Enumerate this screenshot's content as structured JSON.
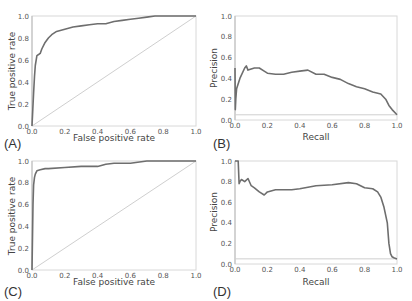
{
  "chart_data": [
    {
      "id": "A",
      "panel_label": "(A)",
      "type": "line",
      "title": "",
      "xlabel": "False positive rate",
      "ylabel": "True positive rate",
      "xlim": [
        0,
        1
      ],
      "ylim": [
        0,
        1
      ],
      "xticks": [
        "0.0",
        "0.2",
        "0.4",
        "0.6",
        "0.8",
        "1.0"
      ],
      "yticks": [
        "0.0",
        "0.2",
        "0.4",
        "0.6",
        "0.8",
        "1.0"
      ],
      "grid": false,
      "diagonal": true,
      "series": [
        {
          "name": "ROC",
          "x": [
            0,
            0.005,
            0.01,
            0.015,
            0.02,
            0.03,
            0.04,
            0.05,
            0.06,
            0.08,
            0.1,
            0.12,
            0.15,
            0.2,
            0.25,
            0.3,
            0.35,
            0.4,
            0.45,
            0.5,
            0.55,
            0.6,
            0.65,
            0.7,
            0.75,
            0.8,
            0.9,
            1.0
          ],
          "y": [
            0,
            0.15,
            0.3,
            0.45,
            0.55,
            0.64,
            0.65,
            0.66,
            0.7,
            0.76,
            0.8,
            0.83,
            0.86,
            0.88,
            0.9,
            0.91,
            0.92,
            0.93,
            0.93,
            0.95,
            0.96,
            0.97,
            0.98,
            0.99,
            1.0,
            1.0,
            1.0,
            1.0
          ]
        }
      ]
    },
    {
      "id": "B",
      "panel_label": "(B)",
      "type": "line",
      "title": "",
      "xlabel": "Recall",
      "ylabel": "Precision",
      "xlim": [
        0,
        1
      ],
      "ylim": [
        0,
        1
      ],
      "xticks": [
        "0.0",
        "0.2",
        "0.4",
        "0.6",
        "0.8",
        "1.0"
      ],
      "yticks": [
        "0.0",
        "0.2",
        "0.4",
        "0.6",
        "0.8",
        "1.0"
      ],
      "grid": false,
      "baseline": 0.05,
      "series": [
        {
          "name": "PR",
          "x": [
            0,
            0.002,
            0.005,
            0.01,
            0.03,
            0.06,
            0.07,
            0.08,
            0.1,
            0.12,
            0.15,
            0.18,
            0.2,
            0.25,
            0.3,
            0.35,
            0.4,
            0.45,
            0.5,
            0.55,
            0.6,
            0.65,
            0.7,
            0.75,
            0.8,
            0.85,
            0.9,
            0.93,
            0.95,
            0.97,
            1.0
          ],
          "y": [
            0.5,
            0.1,
            0.2,
            0.3,
            0.4,
            0.5,
            0.52,
            0.48,
            0.49,
            0.5,
            0.5,
            0.47,
            0.45,
            0.44,
            0.44,
            0.46,
            0.47,
            0.48,
            0.44,
            0.44,
            0.41,
            0.39,
            0.35,
            0.32,
            0.3,
            0.27,
            0.25,
            0.2,
            0.14,
            0.1,
            0.05
          ]
        }
      ]
    },
    {
      "id": "C",
      "panel_label": "(C)",
      "type": "line",
      "title": "",
      "xlabel": "False positive rate",
      "ylabel": "True positive rate",
      "xlim": [
        0,
        1
      ],
      "ylim": [
        0,
        1
      ],
      "xticks": [
        "0.0",
        "0.2",
        "0.4",
        "0.6",
        "0.8",
        "1.0"
      ],
      "yticks": [
        "0.0",
        "0.2",
        "0.4",
        "0.6",
        "0.8",
        "1.0"
      ],
      "grid": false,
      "diagonal": true,
      "series": [
        {
          "name": "ROC",
          "x": [
            0,
            0.003,
            0.006,
            0.01,
            0.015,
            0.02,
            0.03,
            0.05,
            0.08,
            0.1,
            0.2,
            0.3,
            0.4,
            0.45,
            0.5,
            0.6,
            0.7,
            0.8,
            0.9,
            1.0
          ],
          "y": [
            0,
            0.3,
            0.6,
            0.78,
            0.85,
            0.88,
            0.91,
            0.92,
            0.93,
            0.93,
            0.94,
            0.95,
            0.95,
            0.97,
            0.98,
            0.98,
            1.0,
            1.0,
            1.0,
            1.0
          ]
        }
      ]
    },
    {
      "id": "D",
      "panel_label": "(D)",
      "type": "line",
      "title": "",
      "xlabel": "Recall",
      "ylabel": "Precision",
      "xlim": [
        0,
        1
      ],
      "ylim": [
        0,
        1
      ],
      "xticks": [
        "0.0",
        "0.2",
        "0.4",
        "0.6",
        "0.8",
        "1.0"
      ],
      "yticks": [
        "0.0",
        "0.2",
        "0.4",
        "0.6",
        "0.8",
        "1.0"
      ],
      "grid": false,
      "baseline": 0.05,
      "series": [
        {
          "name": "PR",
          "x": [
            0,
            0.02,
            0.025,
            0.03,
            0.04,
            0.06,
            0.08,
            0.1,
            0.12,
            0.15,
            0.18,
            0.2,
            0.25,
            0.3,
            0.35,
            0.4,
            0.5,
            0.6,
            0.7,
            0.75,
            0.8,
            0.85,
            0.88,
            0.9,
            0.92,
            0.94,
            0.95,
            0.96,
            0.97,
            0.98,
            1.0
          ],
          "y": [
            1.0,
            1.0,
            0.78,
            0.8,
            0.82,
            0.8,
            0.83,
            0.76,
            0.74,
            0.7,
            0.67,
            0.7,
            0.72,
            0.72,
            0.72,
            0.73,
            0.76,
            0.77,
            0.79,
            0.78,
            0.74,
            0.73,
            0.7,
            0.65,
            0.55,
            0.4,
            0.2,
            0.1,
            0.07,
            0.06,
            0.05
          ]
        }
      ]
    }
  ],
  "panels": {
    "A": {
      "label": "(A)",
      "xlabel": "False positive rate",
      "ylabel": "True positive rate"
    },
    "B": {
      "label": "(B)",
      "xlabel": "Recall",
      "ylabel": "Precision"
    },
    "C": {
      "label": "(C)",
      "xlabel": "False positive rate",
      "ylabel": "True positive rate"
    },
    "D": {
      "label": "(D)",
      "xlabel": "Recall",
      "ylabel": "Precision"
    }
  },
  "colors": {
    "curve": "#6e6e6e",
    "diagonal": "#cfcfcf",
    "frame": "#d8d8d8",
    "text": "#444444"
  }
}
